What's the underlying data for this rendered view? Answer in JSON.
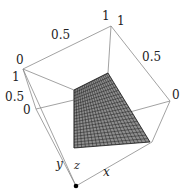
{
  "figure": {
    "type": "3d-surface-plot",
    "axes": {
      "x": {
        "label": "x"
      },
      "y": {
        "label": "y"
      },
      "z": {
        "label": "z"
      }
    },
    "tick_labels": {
      "top_left_edge": [
        "0",
        "0.5",
        "1"
      ],
      "top_right_edge": [
        "1",
        "0.5",
        "0"
      ],
      "left_vertical": [
        "1",
        "0.5",
        "0"
      ]
    },
    "colors": {
      "frame": "#777777",
      "mesh_fill": "#9a9a9a",
      "mesh_lines": "#222222",
      "origin_dot": "#000000"
    },
    "surface": {
      "description": "planar quadrilateral mesh patch",
      "grid_divisions": 20
    }
  }
}
